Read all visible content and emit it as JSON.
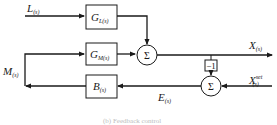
{
  "diagram": {
    "inputs": {
      "load": {
        "symbol": "L",
        "sub": "(s)"
      },
      "manipulated": {
        "symbol": "M",
        "sub": "(s)"
      },
      "setpoint": {
        "symbol": "X",
        "sup": "set",
        "sub": "(s)"
      }
    },
    "outputs": {
      "controlled": {
        "symbol": "X",
        "sub": "(s)"
      },
      "error": {
        "symbol": "E",
        "sub": "(s)"
      }
    },
    "blocks": [
      {
        "id": "GL",
        "symbol": "G",
        "sub": "L(s)"
      },
      {
        "id": "GM",
        "symbol": "G",
        "sub": "M(s)"
      },
      {
        "id": "B",
        "symbol": "B",
        "sub": "(s)"
      },
      {
        "id": "neg",
        "label": "−1"
      }
    ],
    "summers": [
      {
        "id": "sum1",
        "label": "Σ"
      },
      {
        "id": "sum2",
        "label": "Σ"
      }
    ],
    "caption": "(b) Feedback control"
  },
  "colors": {
    "line": "#1a1a1a",
    "background": "#ffffff",
    "caption": "#bdbdbd"
  }
}
